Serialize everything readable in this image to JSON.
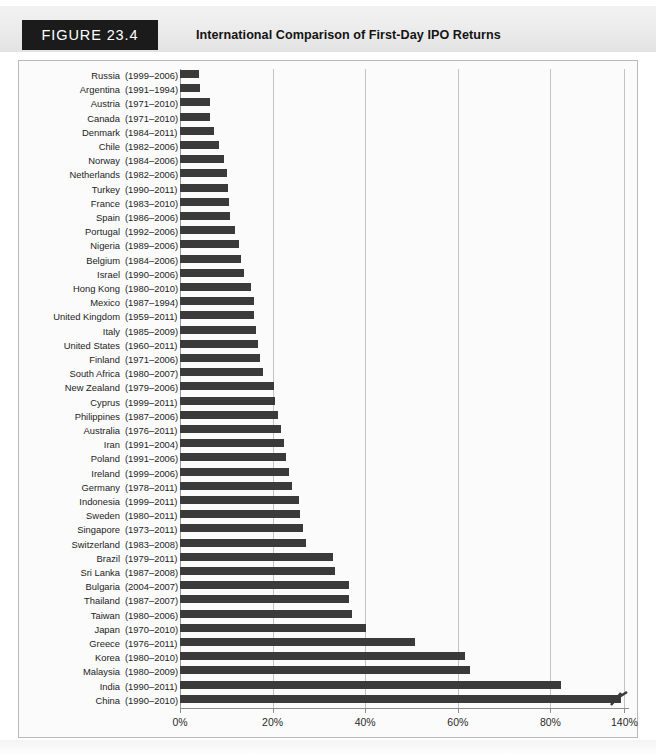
{
  "header": {
    "figure_tag": "FIGURE 23.4",
    "title": "International Comparison of First-Day IPO Returns"
  },
  "colors": {
    "bar": "#3a3a3a",
    "tag_background": "#1b1b1b",
    "tag_text": "#ffffff",
    "grid": "#c2c2c2",
    "plot_background": "#fbfbfb",
    "frame_border": "#b9b9b9"
  },
  "chart_data": {
    "type": "bar",
    "orientation": "horizontal",
    "title": "International Comparison of First-Day IPO Returns",
    "xlabel": "",
    "ylabel": "",
    "xlim": [
      0,
      140
    ],
    "grid": true,
    "legend": false,
    "axis_break": {
      "present": true,
      "after": 80,
      "resumes_at": 140,
      "marker": "zigzag"
    },
    "tick_labels": [
      "0%",
      "20%",
      "40%",
      "60%",
      "80%",
      "140%"
    ],
    "tick_values": [
      0,
      20,
      40,
      60,
      80,
      140
    ],
    "categories": [
      "Russia",
      "Argentina",
      "Austria",
      "Canada",
      "Denmark",
      "Chile",
      "Norway",
      "Netherlands",
      "Turkey",
      "France",
      "Spain",
      "Portugal",
      "Nigeria",
      "Belgium",
      "Israel",
      "Hong Kong",
      "Mexico",
      "United Kingdom",
      "Italy",
      "United States",
      "Finland",
      "South Africa",
      "New Zealand",
      "Cyprus",
      "Philippines",
      "Australia",
      "Iran",
      "Poland",
      "Ireland",
      "Germany",
      "Indonesia",
      "Sweden",
      "Singapore",
      "Switzerland",
      "Brazil",
      "Sri Lanka",
      "Bulgaria",
      "Thailand",
      "Taiwan",
      "Japan",
      "Greece",
      "Korea",
      "Malaysia",
      "India",
      "China"
    ],
    "values": [
      4.2,
      4.4,
      6.4,
      6.5,
      7.4,
      8.4,
      9.6,
      10.2,
      10.3,
      10.5,
      10.9,
      11.9,
      12.7,
      13.1,
      13.8,
      15.4,
      15.9,
      16.0,
      16.4,
      16.8,
      17.2,
      18.0,
      20.3,
      20.6,
      21.2,
      21.8,
      22.4,
      22.9,
      23.6,
      24.2,
      25.6,
      26.0,
      26.5,
      27.3,
      33.1,
      33.5,
      36.5,
      36.6,
      37.2,
      40.2,
      50.8,
      61.6,
      62.6,
      88.5,
      137.4
    ],
    "rows": [
      {
        "country": "Russia",
        "years": "(1999–2006)",
        "value": 4.2,
        "broken": false
      },
      {
        "country": "Argentina",
        "years": "(1991–1994)",
        "value": 4.4,
        "broken": false
      },
      {
        "country": "Austria",
        "years": "(1971–2010)",
        "value": 6.4,
        "broken": false
      },
      {
        "country": "Canada",
        "years": "(1971–2010)",
        "value": 6.5,
        "broken": false
      },
      {
        "country": "Denmark",
        "years": "(1984–2011)",
        "value": 7.4,
        "broken": false
      },
      {
        "country": "Chile",
        "years": "(1982–2006)",
        "value": 8.4,
        "broken": false
      },
      {
        "country": "Norway",
        "years": "(1984–2006)",
        "value": 9.6,
        "broken": false
      },
      {
        "country": "Netherlands",
        "years": "(1982–2006)",
        "value": 10.2,
        "broken": false
      },
      {
        "country": "Turkey",
        "years": "(1990–2011)",
        "value": 10.3,
        "broken": false
      },
      {
        "country": "France",
        "years": "(1983–2010)",
        "value": 10.5,
        "broken": false
      },
      {
        "country": "Spain",
        "years": "(1986–2006)",
        "value": 10.9,
        "broken": false
      },
      {
        "country": "Portugal",
        "years": "(1992–2006)",
        "value": 11.9,
        "broken": false
      },
      {
        "country": "Nigeria",
        "years": "(1989–2006)",
        "value": 12.7,
        "broken": false
      },
      {
        "country": "Belgium",
        "years": "(1984–2006)",
        "value": 13.1,
        "broken": false
      },
      {
        "country": "Israel",
        "years": "(1990–2006)",
        "value": 13.8,
        "broken": false
      },
      {
        "country": "Hong Kong",
        "years": "(1980–2010)",
        "value": 15.4,
        "broken": false
      },
      {
        "country": "Mexico",
        "years": "(1987–1994)",
        "value": 15.9,
        "broken": false
      },
      {
        "country": "United Kingdom",
        "years": "(1959–2011)",
        "value": 16.0,
        "broken": false
      },
      {
        "country": "Italy",
        "years": "(1985–2009)",
        "value": 16.4,
        "broken": false
      },
      {
        "country": "United States",
        "years": "(1960–2011)",
        "value": 16.8,
        "broken": false
      },
      {
        "country": "Finland",
        "years": "(1971–2006)",
        "value": 17.2,
        "broken": false
      },
      {
        "country": "South Africa",
        "years": "(1980–2007)",
        "value": 18.0,
        "broken": false
      },
      {
        "country": "New Zealand",
        "years": "(1979–2006)",
        "value": 20.3,
        "broken": false
      },
      {
        "country": "Cyprus",
        "years": "(1999–2011)",
        "value": 20.6,
        "broken": false
      },
      {
        "country": "Philippines",
        "years": "(1987–2006)",
        "value": 21.2,
        "broken": false
      },
      {
        "country": "Australia",
        "years": "(1976–2011)",
        "value": 21.8,
        "broken": false
      },
      {
        "country": "Iran",
        "years": "(1991–2004)",
        "value": 22.4,
        "broken": false
      },
      {
        "country": "Poland",
        "years": "(1991–2006)",
        "value": 22.9,
        "broken": false
      },
      {
        "country": "Ireland",
        "years": "(1999–2006)",
        "value": 23.6,
        "broken": false
      },
      {
        "country": "Germany",
        "years": "(1978–2011)",
        "value": 24.2,
        "broken": false
      },
      {
        "country": "Indonesia",
        "years": "(1999–2011)",
        "value": 25.6,
        "broken": false
      },
      {
        "country": "Sweden",
        "years": "(1980–2011)",
        "value": 26.0,
        "broken": false
      },
      {
        "country": "Singapore",
        "years": "(1973–2011)",
        "value": 26.5,
        "broken": false
      },
      {
        "country": "Switzerland",
        "years": "(1983–2008)",
        "value": 27.3,
        "broken": false
      },
      {
        "country": "Brazil",
        "years": "(1979–2011)",
        "value": 33.1,
        "broken": false
      },
      {
        "country": "Sri Lanka",
        "years": "(1987–2008)",
        "value": 33.5,
        "broken": false
      },
      {
        "country": "Bulgaria",
        "years": "(2004–2007)",
        "value": 36.5,
        "broken": false
      },
      {
        "country": "Thailand",
        "years": "(1987–2007)",
        "value": 36.6,
        "broken": false
      },
      {
        "country": "Taiwan",
        "years": "(1980–2006)",
        "value": 37.2,
        "broken": false
      },
      {
        "country": "Japan",
        "years": "(1970–2010)",
        "value": 40.2,
        "broken": false
      },
      {
        "country": "Greece",
        "years": "(1976–2011)",
        "value": 50.8,
        "broken": false
      },
      {
        "country": "Korea",
        "years": "(1980–2010)",
        "value": 61.6,
        "broken": false
      },
      {
        "country": "Malaysia",
        "years": "(1980–2009)",
        "value": 62.6,
        "broken": false
      },
      {
        "country": "India",
        "years": "(1990–2011)",
        "value": 88.5,
        "broken": false
      },
      {
        "country": "China",
        "years": "(1990–2010)",
        "value": 137.4,
        "broken": true
      }
    ]
  }
}
